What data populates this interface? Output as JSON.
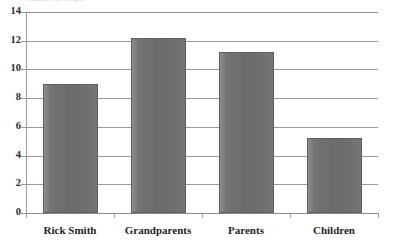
{
  "chart_data": {
    "type": "bar",
    "title": "",
    "title_remnant": "Number of People",
    "xlabel": "",
    "ylabel": "",
    "categories": [
      "Rick Smith",
      "Grandparents",
      "Parents",
      "Children"
    ],
    "values": [
      9.0,
      12.2,
      11.2,
      5.2
    ],
    "series": [
      {
        "name": "Series 1",
        "values": [
          9.0,
          12.2,
          11.2,
          5.2
        ]
      }
    ],
    "ylim": [
      0,
      14
    ],
    "ytick_labels": [
      "0",
      "2",
      "4",
      "6",
      "8",
      "10",
      "12",
      "14"
    ],
    "ytick_values": [
      0,
      2,
      4,
      6,
      8,
      10,
      12,
      14
    ],
    "grid": true,
    "grid_axis": "y",
    "legend": false,
    "legend_position": "none",
    "bar_color": "#6e6e6e",
    "bar_border_color": "#5f5f5f",
    "gridline_color": "#9a9a9a",
    "axis_color": "#9a9a9a",
    "text_color": "#1f1f1f",
    "background_color": "#ffffff"
  }
}
